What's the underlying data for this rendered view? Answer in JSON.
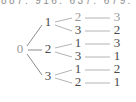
{
  "figure": {
    "type": "tree-diagram",
    "width": 136,
    "height": 102,
    "cut_off_header_text": "887. 916. 637. 679. 73",
    "colors": {
      "background": "#ffffff",
      "edge": "#b4b4b4",
      "label": "#4a4a4a",
      "label_dim": "#9a9a9a"
    }
  },
  "tree": {
    "root": {
      "label": "0",
      "x": 20,
      "y": 50
    },
    "level1": [
      {
        "label": "1",
        "x": 48,
        "y": 23
      },
      {
        "label": "2",
        "x": 48,
        "y": 50
      },
      {
        "label": "3",
        "x": 48,
        "y": 77
      }
    ],
    "level2": [
      {
        "label": "2",
        "x": 78,
        "y": 18,
        "parent": 0
      },
      {
        "label": "3",
        "x": 78,
        "y": 31,
        "parent": 0
      },
      {
        "label": "1",
        "x": 78,
        "y": 44,
        "parent": 1
      },
      {
        "label": "3",
        "x": 78,
        "y": 57,
        "parent": 1
      },
      {
        "label": "1",
        "x": 78,
        "y": 70,
        "parent": 2
      },
      {
        "label": "2",
        "x": 78,
        "y": 83,
        "parent": 2
      }
    ],
    "level3": [
      {
        "label": "3",
        "x": 117,
        "y": 18,
        "parent": 0
      },
      {
        "label": "2",
        "x": 117,
        "y": 31,
        "parent": 1
      },
      {
        "label": "3",
        "x": 117,
        "y": 44,
        "parent": 2
      },
      {
        "label": "1",
        "x": 117,
        "y": 57,
        "parent": 3
      },
      {
        "label": "2",
        "x": 117,
        "y": 70,
        "parent": 4
      },
      {
        "label": "1",
        "x": 117,
        "y": 83,
        "parent": 5
      }
    ],
    "paths": [
      [
        "0",
        "1",
        "2",
        "3"
      ],
      [
        "0",
        "1",
        "3",
        "2"
      ],
      [
        "0",
        "2",
        "1",
        "3"
      ],
      [
        "0",
        "2",
        "3",
        "1"
      ],
      [
        "0",
        "3",
        "1",
        "2"
      ],
      [
        "0",
        "3",
        "2",
        "1"
      ]
    ]
  }
}
